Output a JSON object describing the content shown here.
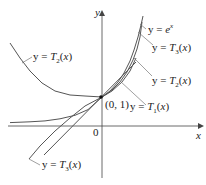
{
  "diagram": {
    "axis_x_label": "x",
    "axis_y_label": "y",
    "origin_label": "0",
    "point_label": "(0, 1)",
    "labels": {
      "ex": "y = e^x",
      "t3_top": "y = T3(x)",
      "t2_right": "y = T2(x)",
      "t1": "y = T1(x)",
      "t2_left": "y = T2(x)",
      "t3_bottom": "y = T3(x)"
    },
    "colors": {
      "curve": "#555555",
      "axis": "#444444",
      "leader": "#777777"
    }
  }
}
